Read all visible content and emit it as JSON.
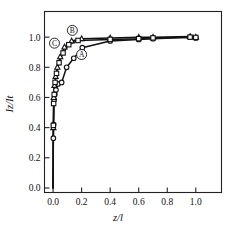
{
  "chart_data": {
    "type": "line",
    "title": "",
    "xlabel": "z/l",
    "ylabel": "Iz/It",
    "xlim": [
      -0.06,
      1.18
    ],
    "ylim": [
      -0.03,
      1.17
    ],
    "xticks": [
      0.0,
      0.2,
      0.4,
      0.6,
      0.8,
      1.0
    ],
    "xticklabels": [
      "0.0",
      "0.2",
      "0.4",
      "0.6",
      "0.8",
      "1.0"
    ],
    "yticks": [
      0.0,
      0.2,
      0.4,
      0.6,
      0.8,
      1.0
    ],
    "yticklabels": [
      "0.0",
      "0.2",
      "0.4",
      "0.6",
      "0.8",
      "1.0"
    ],
    "grid": false,
    "legend": "inline-curve-labels",
    "annotations": [
      {
        "text": "A",
        "circled": true,
        "x": 0.2,
        "y": 0.885
      },
      {
        "text": "B",
        "circled": true,
        "x": 0.135,
        "y": 1.045
      },
      {
        "text": "C",
        "circled": true,
        "x": 0.01,
        "y": 0.96
      }
    ],
    "series": [
      {
        "name": "A",
        "marker": "circle",
        "x": [
          0.0,
          0.002,
          0.004,
          0.007,
          0.012,
          0.02,
          0.035,
          0.06,
          0.095,
          0.145,
          0.205,
          0.4,
          0.6,
          0.7,
          0.96,
          1.0
        ],
        "y": [
          0.0,
          0.33,
          0.42,
          0.585,
          0.62,
          0.65,
          0.69,
          0.7,
          0.8,
          0.86,
          0.93,
          0.975,
          0.985,
          0.99,
          1.0,
          0.995
        ]
      },
      {
        "name": "B",
        "marker": "triangle",
        "x": [
          0.0,
          0.002,
          0.005,
          0.01,
          0.018,
          0.03,
          0.05,
          0.08,
          0.13,
          0.2,
          0.4,
          0.6,
          0.7,
          0.96,
          1.0
        ],
        "y": [
          0.0,
          0.4,
          0.6,
          0.68,
          0.74,
          0.8,
          0.87,
          0.935,
          0.975,
          0.99,
          0.995,
          1.0,
          1.0,
          1.005,
          1.0
        ]
      },
      {
        "name": "C",
        "marker": "square",
        "x": [
          0.0,
          0.002,
          0.004,
          0.008,
          0.014,
          0.024,
          0.042,
          0.07,
          0.11,
          0.175,
          0.4,
          0.6,
          0.7,
          0.96,
          1.0
        ],
        "y": [
          0.0,
          0.415,
          0.56,
          0.62,
          0.7,
          0.76,
          0.83,
          0.895,
          0.95,
          0.978,
          0.985,
          0.99,
          0.995,
          1.0,
          0.998
        ]
      }
    ]
  }
}
